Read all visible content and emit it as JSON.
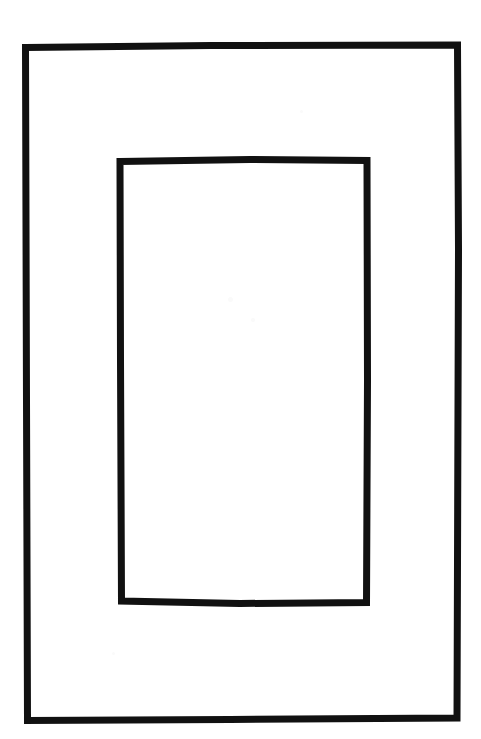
{
  "document": {
    "title": "Nested Rectangles Line Drawing",
    "canvas_width": 481,
    "canvas_height": 739,
    "background_color": "#ffffff",
    "ink_color": "#111111",
    "style": "hand-drawn ink outline, scanned",
    "caption": ""
  },
  "shapes": [
    {
      "name": "outer-rectangle",
      "type": "rectangle",
      "x": 24,
      "y": 44,
      "width": 435,
      "height": 678,
      "stroke_width": 7,
      "stroke_color": "#111111",
      "fill": "none",
      "label": "Outer rectangle"
    },
    {
      "name": "inner-rectangle",
      "type": "rectangle",
      "x": 118,
      "y": 158,
      "width": 252,
      "height": 448,
      "stroke_width": 7,
      "stroke_color": "#111111",
      "fill": "none",
      "label": "Inner rectangle"
    }
  ],
  "paths": {
    "outer": "M 25.5,47.5 L 211,45.5 L 457.5,45.0 L 458.5,250 L 457.0,718.0 L 230,719.5 L 27.5,720.5 L 26.5,400 Z",
    "inner": "M 120.0,161.5 L 250,159.5 L 367.0,160.5 L 367.5,380 L 366.5,602.5 L 240,603.5 L 121.5,601.0 L 120.5,360 Z"
  },
  "speckles": [
    {
      "x": 228,
      "y": 297,
      "size": 5
    },
    {
      "x": 251,
      "y": 318,
      "size": 4
    },
    {
      "x": 112,
      "y": 652,
      "size": 3
    },
    {
      "x": 300,
      "y": 110,
      "size": 3
    }
  ]
}
